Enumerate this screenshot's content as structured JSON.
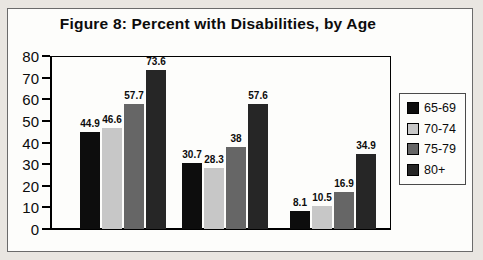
{
  "figure": {
    "title": "Figure 8: Percent with Disabilities, by Age"
  },
  "chart_data": {
    "type": "bar",
    "title": "Figure 8: Percent with Disabilities, by Age",
    "categories": [
      "",
      "",
      ""
    ],
    "series": [
      {
        "name": "65-69",
        "color": "#0d0d0d",
        "values": [
          44.9,
          30.7,
          8.1
        ]
      },
      {
        "name": "70-74",
        "color": "#c7c7c7",
        "values": [
          46.6,
          28.3,
          10.5
        ]
      },
      {
        "name": "75-79",
        "color": "#666666",
        "values": [
          57.7,
          38,
          16.9
        ]
      },
      {
        "name": "80+",
        "color": "#262626",
        "values": [
          73.6,
          57.6,
          34.9
        ]
      }
    ],
    "xlabel": "",
    "ylabel": "",
    "ylim": [
      0,
      80
    ],
    "yticks": [
      0,
      10,
      20,
      30,
      40,
      50,
      60,
      70,
      80
    ],
    "grid": false,
    "value_labels": true,
    "legend_position": "right"
  }
}
